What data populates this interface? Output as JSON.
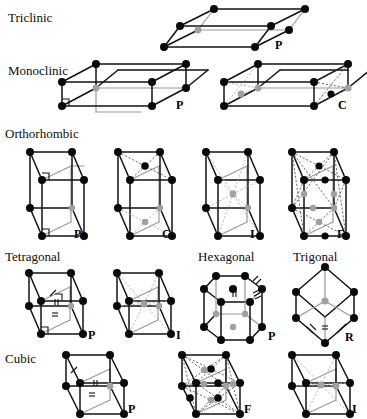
{
  "figure": {
    "colors": {
      "front_node": "#0a0a0a",
      "back_node": "#a0a0a0",
      "front_edge": "#121212",
      "back_edge": "#9a9a9a",
      "dashed_edge": "#4a4a4a",
      "background": "#ffffff"
    }
  },
  "systems": [
    {
      "name": "Triclinic",
      "label_x": 8,
      "label_y": 11,
      "cells": [
        {
          "type": "triclinic",
          "centering": "P",
          "label": "P",
          "ox": 157,
          "oy": 4,
          "label_x": 275,
          "label_y": 39
        }
      ]
    },
    {
      "name": "Monoclinic",
      "label_x": 8,
      "label_y": 64,
      "cells": [
        {
          "type": "monoclinic",
          "centering": "P",
          "label": "P",
          "ox": 60,
          "oy": 63,
          "label_x": 176,
          "label_y": 99
        },
        {
          "type": "monoclinic",
          "centering": "C",
          "label": "C",
          "ox": 222,
          "oy": 63,
          "label_x": 338,
          "label_y": 99
        }
      ]
    },
    {
      "name": "Orthorhombic",
      "label_x": 5,
      "label_y": 127,
      "cells": [
        {
          "type": "orthorhombic",
          "centering": "P",
          "label": "P",
          "ox": 30,
          "oy": 146,
          "label_x": 74,
          "label_y": 228
        },
        {
          "type": "orthorhombic",
          "centering": "C",
          "label": "C",
          "ox": 118,
          "oy": 146,
          "label_x": 162,
          "label_y": 228
        },
        {
          "type": "orthorhombic",
          "centering": "I",
          "label": "I",
          "ox": 206,
          "oy": 146,
          "label_x": 250,
          "label_y": 228
        },
        {
          "type": "orthorhombic",
          "centering": "F",
          "label": "F",
          "ox": 292,
          "oy": 146,
          "label_x": 337,
          "label_y": 228
        }
      ]
    },
    {
      "name": "Tetragonal",
      "label_x": 5,
      "label_y": 250,
      "cells": [
        {
          "type": "tetragonal",
          "centering": "P",
          "label": "P",
          "ox": 24,
          "oy": 268,
          "label_x": 88,
          "label_y": 329
        },
        {
          "type": "tetragonal",
          "centering": "I",
          "label": "I",
          "ox": 112,
          "oy": 268,
          "label_x": 176,
          "label_y": 329
        }
      ]
    },
    {
      "name": "Hexagonal",
      "label_x": 198,
      "label_y": 250,
      "cells": [
        {
          "type": "hexagonal",
          "centering": "P",
          "label": "P",
          "ox": 198,
          "oy": 268,
          "label_x": 268,
          "label_y": 330
        }
      ]
    },
    {
      "name": "Trigonal",
      "label_x": 293,
      "label_y": 250,
      "cells": [
        {
          "type": "trigonal",
          "centering": "R",
          "label": "R",
          "ox": 290,
          "oy": 265,
          "label_x": 345,
          "label_y": 331
        }
      ]
    },
    {
      "name": "Cubic",
      "label_x": 5,
      "label_y": 352,
      "cells": [
        {
          "type": "cubic",
          "centering": "P",
          "label": "P",
          "ox": 62,
          "oy": 352,
          "label_x": 128,
          "label_y": 403
        },
        {
          "type": "cubic",
          "centering": "F",
          "label": "F",
          "ox": 178,
          "oy": 352,
          "label_x": 244,
          "label_y": 403
        },
        {
          "type": "cubic",
          "centering": "I",
          "label": "I",
          "ox": 288,
          "oy": 352,
          "label_x": 352,
          "label_y": 403
        }
      ]
    }
  ]
}
